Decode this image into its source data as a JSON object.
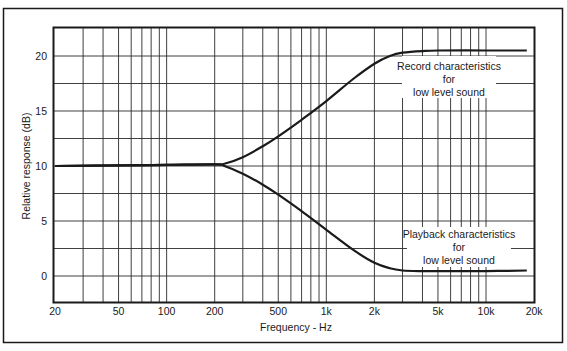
{
  "chart_data": {
    "type": "line",
    "title": "",
    "xlabel": "Frequency - Hz",
    "ylabel": "Relative response (dB)",
    "xscale": "log",
    "xlim": [
      20,
      20000
    ],
    "ylim": [
      -2.5,
      22.6
    ],
    "grid": true,
    "x_ticks": [
      {
        "value": 20,
        "label": "20"
      },
      {
        "value": 50,
        "label": "50"
      },
      {
        "value": 100,
        "label": "100"
      },
      {
        "value": 200,
        "label": "200"
      },
      {
        "value": 500,
        "label": "500"
      },
      {
        "value": 1000,
        "label": "1k"
      },
      {
        "value": 2000,
        "label": "2k"
      },
      {
        "value": 5000,
        "label": "5k"
      },
      {
        "value": 10000,
        "label": "10k"
      },
      {
        "value": 20000,
        "label": "20k"
      }
    ],
    "y_ticks": [
      {
        "value": 0,
        "label": "0"
      },
      {
        "value": 5,
        "label": "5"
      },
      {
        "value": 10,
        "label": "10"
      },
      {
        "value": 15,
        "label": "15"
      },
      {
        "value": 20,
        "label": "20"
      }
    ],
    "y_gridlines": [
      0,
      2.5,
      5,
      7.5,
      10,
      12.5,
      15,
      17.5,
      20
    ],
    "x_gridlines": [
      20,
      30,
      40,
      50,
      60,
      70,
      80,
      90,
      100,
      200,
      300,
      400,
      500,
      600,
      700,
      800,
      900,
      1000,
      2000,
      3000,
      4000,
      5000,
      6000,
      7000,
      8000,
      9000,
      10000,
      20000
    ],
    "series": [
      {
        "name": "Record characteristics for low level sound",
        "x": [
          20,
          50,
          100,
          200,
          230,
          300,
          400,
          500,
          700,
          1000,
          1500,
          2000,
          2500,
          3000,
          4000,
          5000,
          10000,
          18000
        ],
        "y": [
          10.0,
          10.05,
          10.1,
          10.15,
          10.2,
          10.8,
          11.8,
          12.7,
          14.2,
          15.9,
          18.0,
          19.3,
          20.0,
          20.3,
          20.45,
          20.5,
          20.5,
          20.5
        ]
      },
      {
        "name": "Playback characteristics for low level sound",
        "x": [
          20,
          50,
          100,
          200,
          230,
          300,
          400,
          500,
          700,
          1000,
          1500,
          2000,
          2500,
          3000,
          4000,
          5000,
          10000,
          18000
        ],
        "y": [
          10.0,
          10.05,
          10.1,
          10.15,
          10.0,
          9.3,
          8.3,
          7.4,
          5.9,
          4.2,
          2.3,
          1.2,
          0.7,
          0.5,
          0.45,
          0.45,
          0.45,
          0.5
        ]
      }
    ],
    "annotations": [
      {
        "lines": [
          "Record characteristics",
          "for",
          "low level sound"
        ]
      },
      {
        "lines": [
          "Playback characteristics",
          "for",
          "low level sound"
        ]
      }
    ]
  },
  "labels": {
    "xlabel": "Frequency - Hz",
    "ylabel": "Relative response (dB)",
    "record": [
      "Record characteristics",
      "for",
      "low level sound"
    ],
    "playback": [
      "Playback characteristics",
      "for",
      "low level sound"
    ]
  },
  "colors": {
    "ink": "#1a1a1a",
    "grid": "#2a2a2a",
    "background": "#ffffff"
  }
}
